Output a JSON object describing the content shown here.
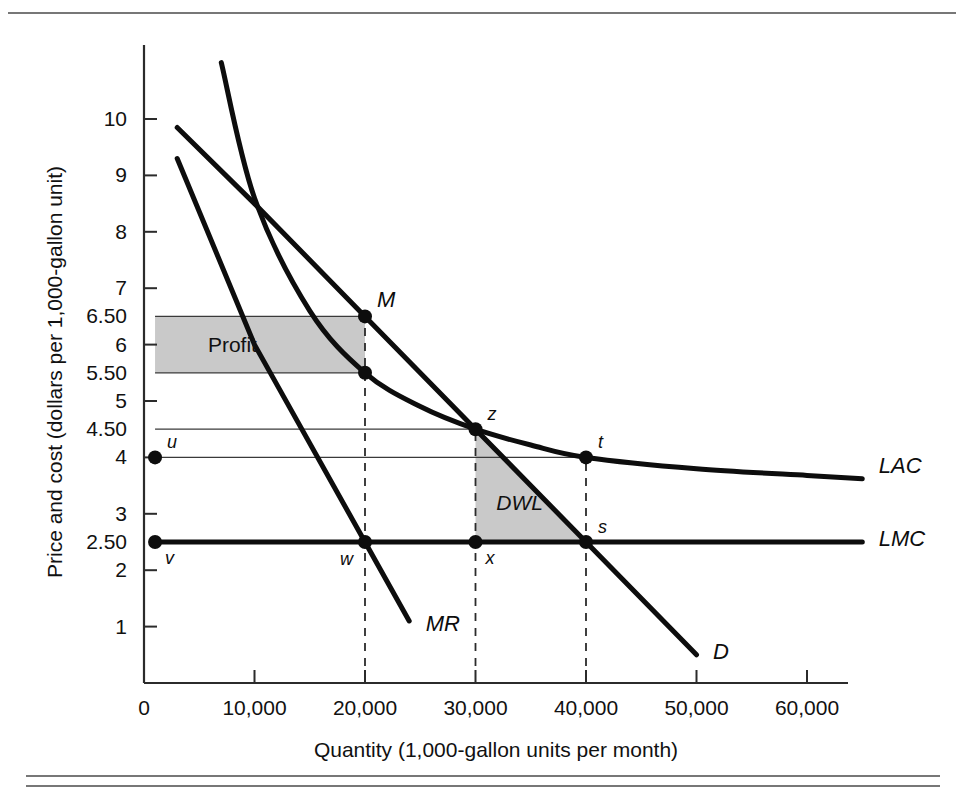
{
  "figure": {
    "background": "#ffffff",
    "shade_color": "#c9c9c9",
    "ink_color": "#0d0d0d"
  },
  "chart_data": {
    "type": "line",
    "title": "",
    "xlabel": "Quantity (1,000-gallon units per month)",
    "ylabel": "Price and cost (dollars per 1,000-gallon unit)",
    "xlim": [
      0,
      68000
    ],
    "ylim": [
      0,
      11
    ],
    "grid": false,
    "legend_position": "inline-right",
    "xticks": [
      0,
      10000,
      20000,
      30000,
      40000,
      50000,
      60000
    ],
    "xtick_labels": [
      "0",
      "10,000",
      "20,000",
      "30,000",
      "40,000",
      "50,000",
      "60,000"
    ],
    "yticks": [
      1,
      2,
      2.5,
      3,
      4,
      4.5,
      5,
      5.5,
      6,
      6.5,
      7,
      8,
      9,
      10
    ],
    "ytick_labels": [
      "1",
      "2",
      "2.50",
      "3",
      "4",
      "4.50",
      "5",
      "5.50",
      "6",
      "6.50",
      "7",
      "8",
      "9",
      "10"
    ],
    "series": [
      {
        "name": "D",
        "label": "D",
        "type": "line",
        "style": "straight-thick",
        "points": [
          [
            3000,
            9.85
          ],
          [
            10000,
            8.5
          ],
          [
            20000,
            6.5
          ],
          [
            30000,
            4.5
          ],
          [
            40000,
            2.5
          ],
          [
            50000,
            0.5
          ]
        ]
      },
      {
        "name": "MR",
        "label": "MR",
        "type": "line",
        "style": "straight-thick",
        "points": [
          [
            3000,
            9.3
          ],
          [
            10000,
            6.0
          ],
          [
            20000,
            2.5
          ],
          [
            24000,
            1.1
          ]
        ]
      },
      {
        "name": "LAC",
        "label": "LAC",
        "type": "curve",
        "style": "convex-decreasing-thick",
        "points": [
          [
            7000,
            11.0
          ],
          [
            10000,
            8.6
          ],
          [
            15000,
            6.6
          ],
          [
            20000,
            5.5
          ],
          [
            25000,
            4.9
          ],
          [
            30000,
            4.5
          ],
          [
            35000,
            4.22
          ],
          [
            40000,
            4.0
          ],
          [
            50000,
            3.8
          ],
          [
            60000,
            3.68
          ],
          [
            65000,
            3.62
          ]
        ]
      },
      {
        "name": "LMC",
        "label": "LMC",
        "type": "line",
        "style": "horizontal-thick",
        "points": [
          [
            1000,
            2.5
          ],
          [
            65000,
            2.5
          ]
        ]
      }
    ],
    "marked_points": [
      {
        "id": "u",
        "label": "u",
        "x": 1000,
        "y": 4.0,
        "label_pos": "upper-right"
      },
      {
        "id": "v",
        "label": "v",
        "x": 1000,
        "y": 2.5,
        "label_pos": "lower-right"
      },
      {
        "id": "M",
        "label": "M",
        "x": 20000,
        "y": 6.5,
        "label_pos": "upper-right"
      },
      {
        "id": "w",
        "label": "w",
        "x": 20000,
        "y": 2.5,
        "label_pos": "lower-left"
      },
      {
        "id": "z",
        "label": "z",
        "x": 30000,
        "y": 4.5,
        "label_pos": "upper-right"
      },
      {
        "id": "x",
        "label": "x",
        "x": 30000,
        "y": 2.5,
        "label_pos": "lower-right"
      },
      {
        "id": "t",
        "label": "t",
        "x": 40000,
        "y": 4.0,
        "label_pos": "upper-right"
      },
      {
        "id": "s",
        "label": "s",
        "x": 40000,
        "y": 2.5,
        "label_pos": "upper-right"
      },
      {
        "id": "lac20",
        "label": "",
        "x": 20000,
        "y": 5.5,
        "label_pos": "none"
      }
    ],
    "shaded_regions": [
      {
        "id": "profit",
        "label": "Profit",
        "type": "rectangle",
        "fill": "#c9c9c9",
        "x_range": [
          1000,
          20000
        ],
        "y_range": [
          5.5,
          6.5
        ],
        "label_x": 8000,
        "label_y": 6.0
      },
      {
        "id": "dwl",
        "label": "DWL",
        "type": "triangle",
        "fill": "#c9c9c9",
        "vertices": [
          [
            30000,
            4.5
          ],
          [
            30000,
            2.5
          ],
          [
            40000,
            2.5
          ]
        ],
        "label_x": 34000,
        "label_y": 3.2
      }
    ],
    "guide_lines": [
      {
        "orientation": "horizontal",
        "y": 6.5,
        "x_from": 1000,
        "x_to": 20000,
        "style": "thin"
      },
      {
        "orientation": "horizontal",
        "y": 5.5,
        "x_from": 1000,
        "x_to": 20000,
        "style": "thin"
      },
      {
        "orientation": "horizontal",
        "y": 4.5,
        "x_from": 1000,
        "x_to": 30000,
        "style": "thin"
      },
      {
        "orientation": "horizontal",
        "y": 4.0,
        "x_from": 1000,
        "x_to": 40000,
        "style": "thin"
      },
      {
        "orientation": "vertical",
        "x": 20000,
        "y_from": 0.3,
        "y_to": 6.5,
        "style": "dashed"
      },
      {
        "orientation": "vertical",
        "x": 30000,
        "y_from": 0.3,
        "y_to": 4.5,
        "style": "dashed"
      },
      {
        "orientation": "vertical",
        "x": 40000,
        "y_from": 0.3,
        "y_to": 4.0,
        "style": "dashed"
      }
    ],
    "curve_labels": [
      {
        "id": "lac",
        "text": "LAC",
        "x": 66500,
        "y": 3.85
      },
      {
        "id": "lmc",
        "text": "LMC",
        "x": 66500,
        "y": 2.55
      },
      {
        "id": "mr",
        "text": "MR",
        "x": 25500,
        "y": 1.05
      },
      {
        "id": "d",
        "text": "D",
        "x": 51500,
        "y": 0.55
      }
    ]
  }
}
